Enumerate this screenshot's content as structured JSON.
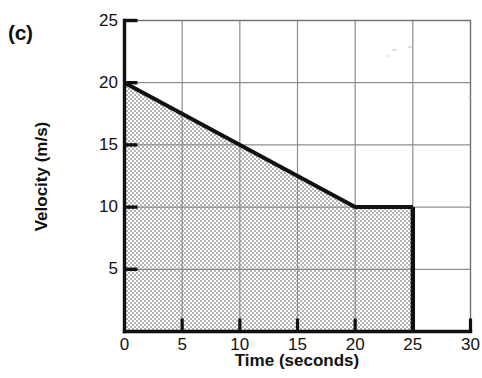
{
  "figure": {
    "panel_label": "(c)",
    "background_color": "#ffffff",
    "ink_color": "#111111",
    "grid_color": "#8d8d8d",
    "fill_color": "#cfcfcf"
  },
  "chart_data": {
    "type": "line",
    "title": "",
    "xlabel": "Time (seconds)",
    "ylabel": "Velocity (m/s)",
    "xlim": [
      0,
      30
    ],
    "ylim": [
      0,
      25
    ],
    "xticks": [
      0,
      5,
      10,
      15,
      20,
      25,
      30
    ],
    "yticks": [
      0,
      5,
      10,
      15,
      20,
      25
    ],
    "xtick_labels": [
      "0",
      "5",
      "10",
      "15",
      "20",
      "25",
      "30"
    ],
    "ytick_labels": [
      "0",
      "5",
      "10",
      "15",
      "20",
      "25"
    ],
    "grid": true,
    "legend": null,
    "series": [
      {
        "name": "velocity",
        "x": [
          0,
          20,
          25
        ],
        "y": [
          20,
          10,
          10
        ],
        "line_color": "#111111",
        "line_width": 4,
        "shaded_under_curve": true,
        "shade_from_x": 0,
        "shade_to_x": 25,
        "shade_baseline": 0
      }
    ],
    "annotations": []
  }
}
